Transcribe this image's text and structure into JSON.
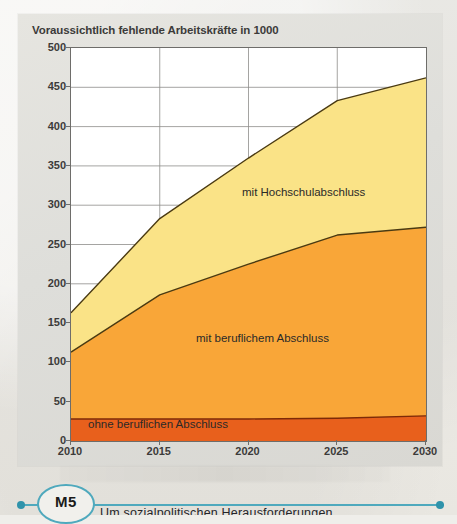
{
  "figure": {
    "title": "Voraussichtlich fehlende Arbeitskräfte in 1000"
  },
  "marker": {
    "badge_label": "M5"
  },
  "caption": {
    "text": "Um  sozialpolitischen  Herausforderungen"
  },
  "chart_data": {
    "type": "area",
    "stacked": true,
    "title": "Voraussichtlich fehlende Arbeitskräfte in 1000",
    "xlabel": "",
    "ylabel": "",
    "unit": "Personen in 1000",
    "grid": true,
    "legend_position": "inline-labels",
    "x": [
      2010,
      2015,
      2020,
      2025,
      2030
    ],
    "xtick_labels": [
      "2010",
      "2015",
      "2020",
      "2025",
      "2030"
    ],
    "xlim": [
      2010,
      2030
    ],
    "ylim": [
      0,
      500
    ],
    "ytick_labels": [
      "0",
      "50",
      "100",
      "150",
      "200",
      "250",
      "300",
      "350",
      "400",
      "450",
      "500"
    ],
    "yticks": [
      0,
      50,
      100,
      150,
      200,
      250,
      300,
      350,
      400,
      450,
      500
    ],
    "series": [
      {
        "name": "ohne beruflichen Abschluss",
        "color": "#e8601c",
        "values": [
          28,
          28,
          28,
          29,
          32
        ],
        "cumulative": [
          28,
          28,
          28,
          29,
          32
        ]
      },
      {
        "name": "mit beruflichem Abschluss",
        "color": "#f9a638",
        "values": [
          85,
          158,
          197,
          233,
          240
        ],
        "cumulative": [
          113,
          186,
          225,
          262,
          272
        ]
      },
      {
        "name": "mit Hochschulabschluss",
        "color": "#fae387",
        "values": [
          50,
          97,
          135,
          171,
          190
        ],
        "cumulative": [
          163,
          283,
          360,
          433,
          462
        ]
      }
    ]
  }
}
